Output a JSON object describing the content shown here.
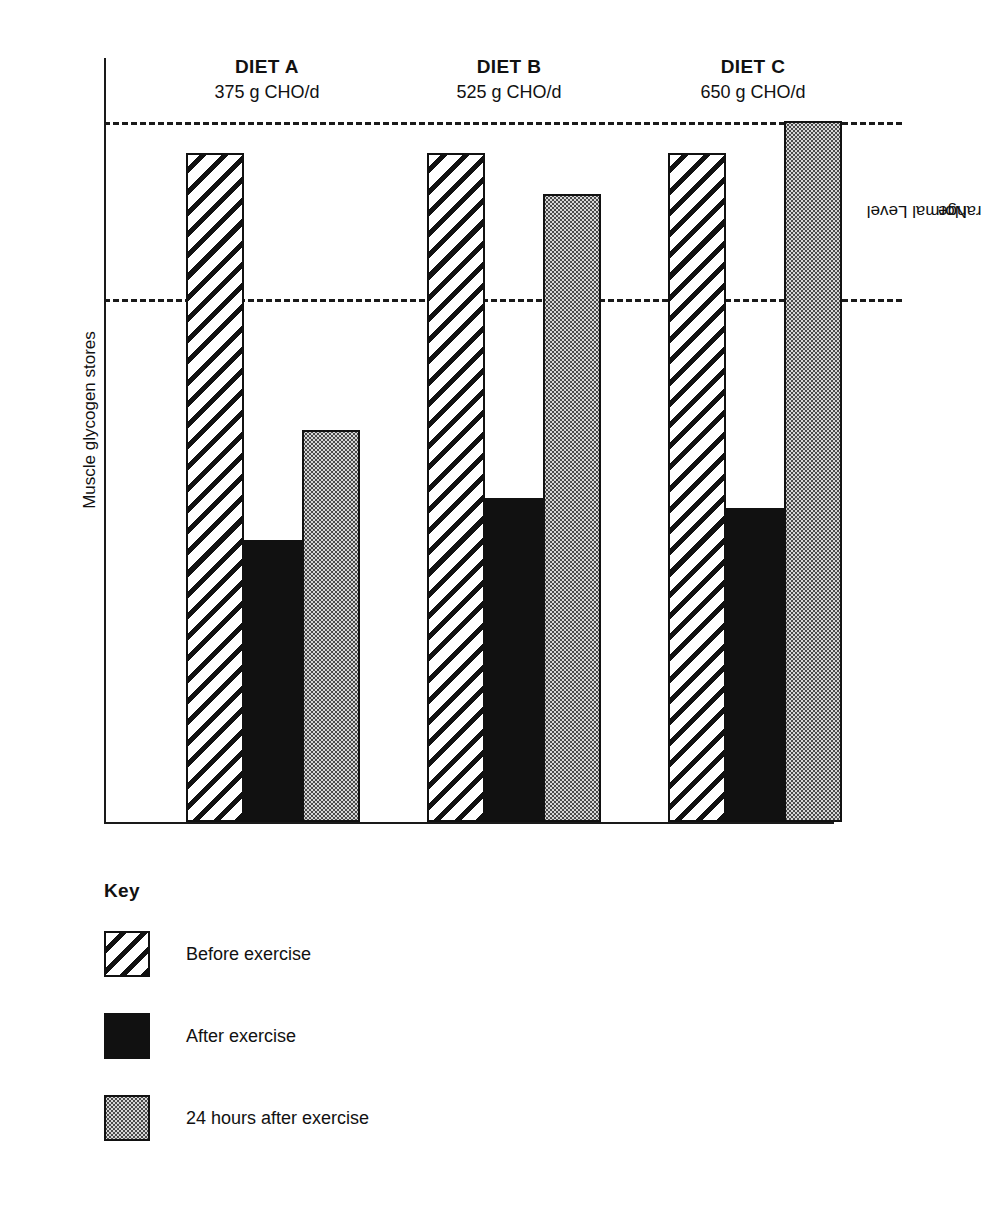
{
  "axis": {
    "ylabel": "Muscle glycogen stores",
    "normal_range_label": "Normal Level\nrange",
    "normal_range_label_line1": "Normal Level",
    "normal_range_label_line2": "range"
  },
  "groups": [
    {
      "name": "DIET A",
      "dose": "375 g CHO/d"
    },
    {
      "name": "DIET B",
      "dose": "525 g CHO/d"
    },
    {
      "name": "DIET C",
      "dose": "650 g CHO/d"
    }
  ],
  "key": {
    "title": "Key",
    "items": [
      {
        "label": "Before exercise",
        "pattern": "diagonal-hatch"
      },
      {
        "label": "After exercise",
        "pattern": "solid-black"
      },
      {
        "label": "24 hours after exercise",
        "pattern": "dotted-stipple"
      }
    ]
  },
  "chart_data": {
    "type": "bar",
    "xlabel": "",
    "ylabel": "Muscle glycogen stores",
    "categories": [
      "DIET A",
      "DIET B",
      "DIET C"
    ],
    "category_sublabels": [
      "375 g CHO/d",
      "525 g CHO/d",
      "650 g CHO/d"
    ],
    "series": [
      {
        "name": "Before exercise",
        "pattern": "diagonal-hatch",
        "values": [
          128,
          128,
          128
        ]
      },
      {
        "name": "After exercise",
        "pattern": "solid-black",
        "values": [
          54,
          62,
          60
        ]
      },
      {
        "name": "24 hours after exercise",
        "pattern": "dotted-stipple",
        "values": [
          75,
          120,
          134
        ]
      }
    ],
    "ylim": [
      0,
      145
    ],
    "y_axis_ticks_shown": false,
    "grid": false,
    "legend": "below-plot",
    "annotations": [
      {
        "text": "Normal Level range",
        "type": "band",
        "y_low": 100,
        "y_high": 134,
        "style": "dashed-lines",
        "position": "right"
      }
    ]
  }
}
